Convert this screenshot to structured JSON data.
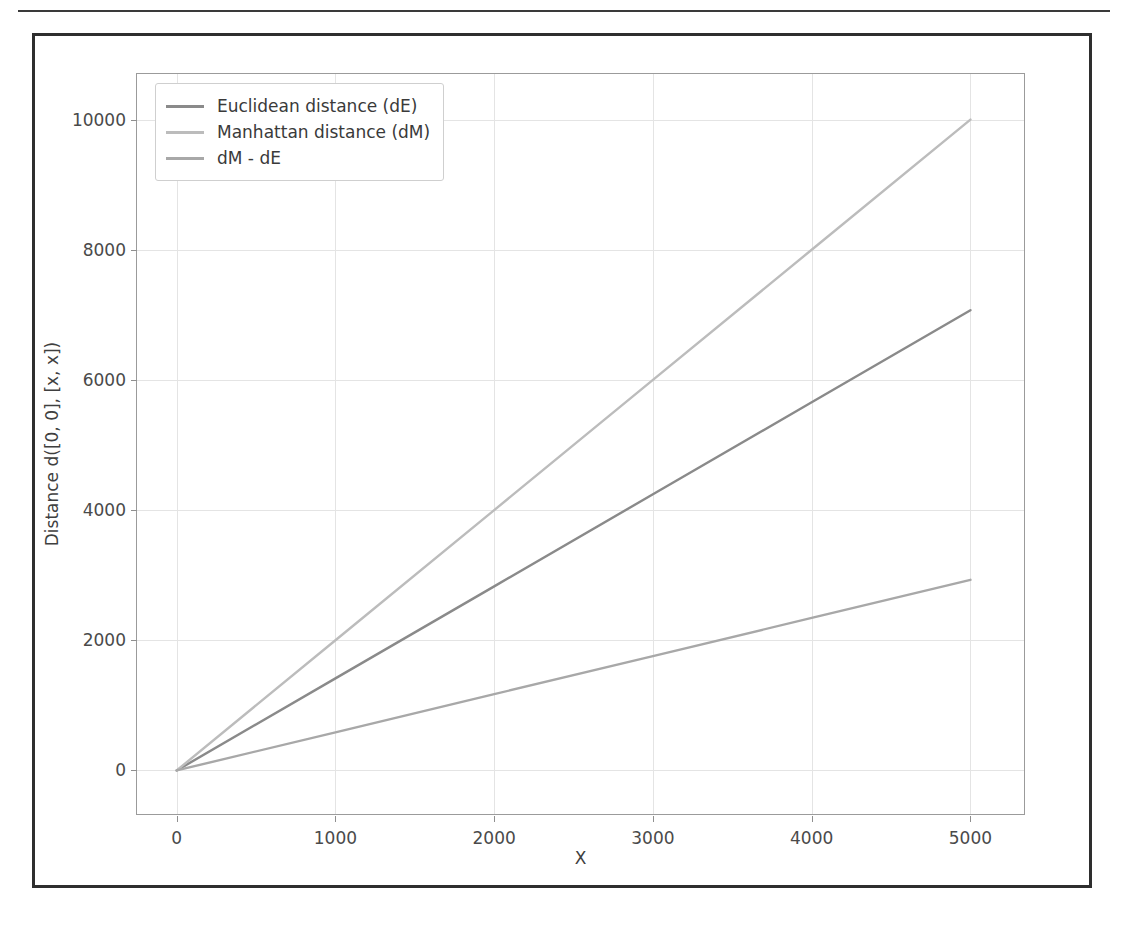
{
  "figure": {
    "background_color": "#ffffff",
    "frame_color": "#2e2e2e"
  },
  "chart_data": {
    "type": "line",
    "title": "",
    "xlabel": "X",
    "ylabel": "Distance d([0, 0], [x, x])",
    "xlim": [
      -250,
      5350
    ],
    "ylim": [
      -700,
      10700
    ],
    "xticks": [
      0,
      1000,
      2000,
      3000,
      4000,
      5000
    ],
    "yticks": [
      0,
      2000,
      4000,
      6000,
      8000,
      10000
    ],
    "xticklabels": [
      "0",
      "1000",
      "2000",
      "3000",
      "4000",
      "5000"
    ],
    "yticklabels": [
      "0",
      "2000",
      "4000",
      "6000",
      "8000",
      "10000"
    ],
    "grid": true,
    "grid_color": "#e4e4e4",
    "legend_position": "upper left",
    "x": [
      0,
      1000,
      2000,
      3000,
      4000,
      5000
    ],
    "series": [
      {
        "name": "Euclidean distance (dE)",
        "color": "#8a8a8a",
        "values": [
          0,
          1414,
          2828,
          4243,
          5657,
          7071
        ]
      },
      {
        "name": "Manhattan distance (dM)",
        "color": "#bcbcbc",
        "values": [
          0,
          2000,
          4000,
          6000,
          8000,
          10000
        ]
      },
      {
        "name": "dM - dE",
        "color": "#a8a8a8",
        "values": [
          0,
          586,
          1172,
          1757,
          2343,
          2929
        ]
      }
    ]
  },
  "legend": {
    "items": [
      {
        "label": "Euclidean distance (dE)"
      },
      {
        "label": "Manhattan distance (dM)"
      },
      {
        "label": "dM - dE"
      }
    ]
  }
}
